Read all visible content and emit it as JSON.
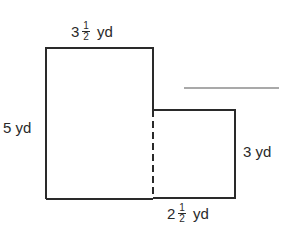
{
  "figure": {
    "type": "composite-rectangle",
    "colors": {
      "stroke": "#2a2a2a",
      "background": "#ffffff"
    },
    "labels": {
      "top_width": {
        "whole": "3",
        "numerator": "1",
        "denominator": "2",
        "unit": "yd"
      },
      "left_height": {
        "text": "5 yd"
      },
      "right_height": {
        "text": "3 yd"
      },
      "bottom_width": {
        "whole": "2",
        "numerator": "1",
        "denominator": "2",
        "unit": "yd"
      }
    },
    "answer_blank": {
      "value": ""
    }
  }
}
